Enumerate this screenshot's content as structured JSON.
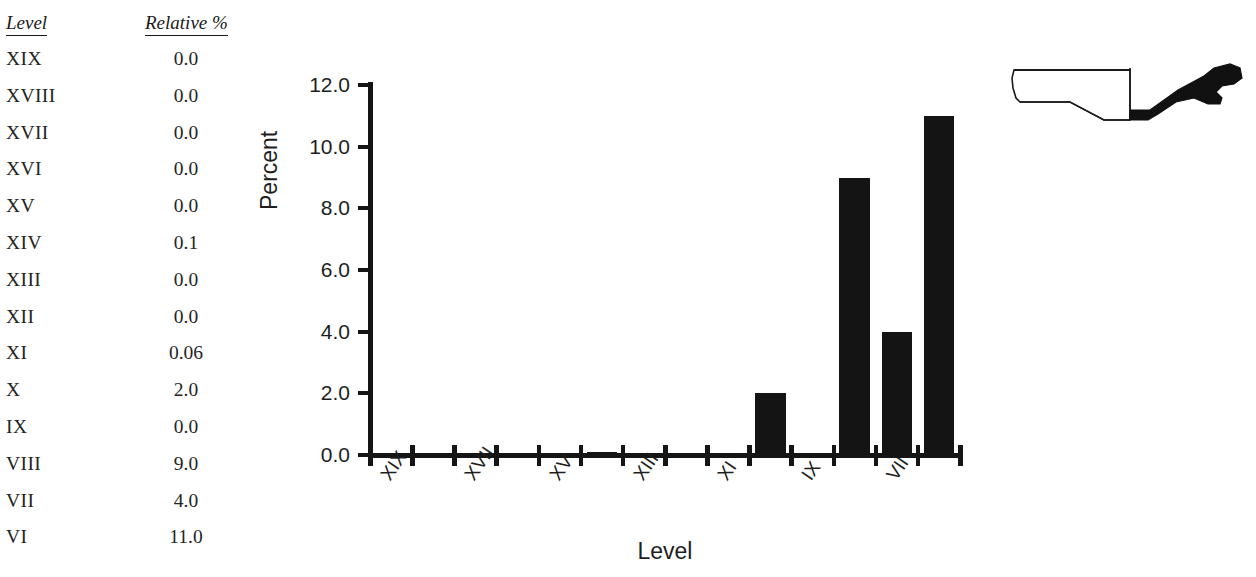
{
  "table": {
    "headers": {
      "level": "Level",
      "percent": "Relative %"
    },
    "rows": [
      {
        "level": "XIX",
        "percent": "0.0"
      },
      {
        "level": "XVIII",
        "percent": "0.0"
      },
      {
        "level": "XVII",
        "percent": "0.0"
      },
      {
        "level": "XVI",
        "percent": "0.0"
      },
      {
        "level": "XV",
        "percent": "0.0"
      },
      {
        "level": "XIV",
        "percent": "0.1"
      },
      {
        "level": "XIII",
        "percent": "0.0"
      },
      {
        "level": "XII",
        "percent": "0.0"
      },
      {
        "level": "XI",
        "percent": "0.06"
      },
      {
        "level": "X",
        "percent": "2.0"
      },
      {
        "level": "IX",
        "percent": "0.0"
      },
      {
        "level": "VIII",
        "percent": "9.0"
      },
      {
        "level": "VII",
        "percent": "4.0"
      },
      {
        "level": "VI",
        "percent": "11.0"
      }
    ]
  },
  "chart_data": {
    "type": "bar",
    "title": "",
    "xlabel": "Level",
    "ylabel": "Percent",
    "categories": [
      "XIX",
      "XVIII",
      "XVII",
      "XVI",
      "XV",
      "XIV",
      "XIII",
      "XII",
      "XI",
      "X",
      "IX",
      "VIII",
      "VII",
      "VI"
    ],
    "values": [
      0.0,
      0.0,
      0.0,
      0.0,
      0.0,
      0.1,
      0.0,
      0.0,
      0.06,
      2.0,
      0.0,
      9.0,
      4.0,
      11.0
    ],
    "ylim": [
      0,
      12
    ],
    "yticks": [
      0.0,
      2.0,
      4.0,
      6.0,
      8.0,
      10.0,
      12.0
    ],
    "ytick_labels": [
      "0.0",
      "2.0",
      "4.0",
      "6.0",
      "8.0",
      "10.0",
      "12.0"
    ],
    "xtick_labels_shown": [
      "XIX",
      "XVII",
      "XV",
      "XIII",
      "XI",
      "IX",
      "VII"
    ],
    "xtick_label_every": 2,
    "grid": false,
    "legend": false,
    "bar_color": "#141414",
    "axis_color": "#151515"
  },
  "vessel": {
    "name": "vessel-profile-drawing",
    "description": "ceramic bowl profile with flanged rim",
    "outline_color": "#1a1a1a",
    "section_fill": "#111111"
  }
}
